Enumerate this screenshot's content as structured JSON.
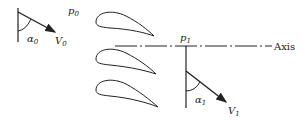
{
  "diagram": {
    "labels": {
      "p0": "p",
      "p0_sub": "0",
      "V0": "V",
      "V0_sub": "0",
      "alpha0": "α",
      "alpha0_sub": "0",
      "p1": "p",
      "p1_sub": "1",
      "V1": "V",
      "V1_sub": "1",
      "alpha1": "α",
      "alpha1_sub": "1",
      "axis": "Axis"
    },
    "airfoil_count": 3,
    "line_color": "#222222"
  }
}
